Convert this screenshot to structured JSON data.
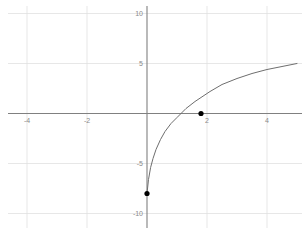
{
  "chart_data": {
    "type": "line",
    "title": "",
    "xlabel": "",
    "ylabel": "",
    "xlim": [
      -4.9,
      5.2
    ],
    "ylim": [
      -11.4,
      11.8
    ],
    "grid": true,
    "grid_color": "#dcdcdc",
    "axis_color": "#808080",
    "curve_color": "#6e6e6e",
    "point_color": "#000000",
    "legend": "none",
    "x_ticks": [
      -4,
      -2,
      2,
      4
    ],
    "x_tick_labels": [
      "-4",
      "-2",
      "2",
      "4"
    ],
    "y_ticks": [
      10,
      5,
      -5,
      -10
    ],
    "y_tick_labels": [
      "10",
      "5",
      "-5",
      "-10"
    ],
    "annotated_points": [
      {
        "name": "endpoint",
        "x": 0,
        "y": -8,
        "label": ""
      },
      {
        "name": "x-intercept",
        "x": 1.8,
        "y": 0,
        "label": ""
      }
    ],
    "series": [
      {
        "name": "log-curve",
        "x": [
          0.0,
          0.05,
          0.12,
          0.2,
          0.3,
          0.45,
          0.6,
          0.8,
          1.0,
          1.3,
          1.6,
          1.8,
          2.1,
          2.5,
          3.0,
          3.5,
          4.0,
          4.5,
          5.0
        ],
        "y": [
          -8.0,
          -6.6,
          -5.4,
          -4.5,
          -3.6,
          -2.6,
          -1.8,
          -1.0,
          -0.4,
          0.5,
          1.2,
          1.6,
          2.2,
          2.9,
          3.5,
          4.0,
          4.4,
          4.7,
          5.0
        ]
      }
    ]
  },
  "geometry": {
    "origin_px": {
      "x": 147,
      "y": 113.5
    },
    "scale_px_per_unit": {
      "x": 30.0,
      "y": 10.0
    }
  }
}
